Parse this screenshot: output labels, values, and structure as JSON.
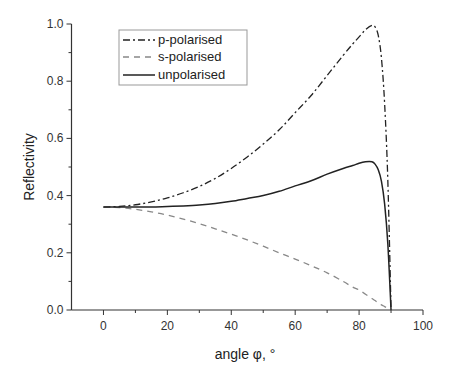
{
  "chart_data": {
    "type": "line",
    "title": "",
    "xlabel": "angle φ, °",
    "ylabel": "Reflectivity",
    "xlim": [
      -10,
      100
    ],
    "ylim": [
      0.0,
      1.0
    ],
    "xticks": [
      "0",
      "20",
      "40",
      "60",
      "80",
      "100"
    ],
    "xtick_values": [
      0,
      20,
      40,
      60,
      80,
      100
    ],
    "yticks": [
      "0.0",
      "0.2",
      "0.4",
      "0.6",
      "0.8",
      "1.0"
    ],
    "ytick_values": [
      0.0,
      0.2,
      0.4,
      0.6,
      0.8,
      1.0
    ],
    "grid": false,
    "legend_position": "upper-left",
    "x": [
      0,
      5,
      10,
      15,
      20,
      25,
      30,
      35,
      40,
      45,
      50,
      55,
      60,
      65,
      70,
      75,
      78,
      80,
      82,
      84,
      85,
      86,
      87,
      88,
      89,
      90
    ],
    "series": [
      {
        "name": "p-polarised",
        "style": "dash-dot",
        "color": "#222222",
        "values": [
          0.36,
          0.362,
          0.368,
          0.378,
          0.392,
          0.41,
          0.432,
          0.46,
          0.495,
          0.535,
          0.58,
          0.63,
          0.69,
          0.75,
          0.82,
          0.89,
          0.93,
          0.955,
          0.98,
          0.995,
          0.99,
          0.96,
          0.88,
          0.72,
          0.45,
          0.0
        ]
      },
      {
        "name": "s-polarised",
        "style": "dashed",
        "color": "#888888",
        "values": [
          0.36,
          0.358,
          0.352,
          0.343,
          0.332,
          0.318,
          0.302,
          0.284,
          0.265,
          0.245,
          0.223,
          0.2,
          0.178,
          0.155,
          0.13,
          0.1,
          0.08,
          0.07,
          0.055,
          0.04,
          0.033,
          0.025,
          0.018,
          0.012,
          0.006,
          0.0
        ]
      },
      {
        "name": "unpolarised",
        "style": "solid",
        "color": "#222222",
        "values": [
          0.36,
          0.36,
          0.36,
          0.36,
          0.362,
          0.364,
          0.367,
          0.372,
          0.38,
          0.39,
          0.4,
          0.415,
          0.434,
          0.452,
          0.475,
          0.495,
          0.505,
          0.513,
          0.518,
          0.518,
          0.51,
          0.49,
          0.45,
          0.37,
          0.23,
          0.0
        ]
      }
    ]
  }
}
